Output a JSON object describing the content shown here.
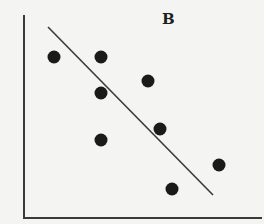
{
  "chart_data": {
    "type": "scatter",
    "title": "B",
    "xlabel": "",
    "ylabel": "",
    "xlim": [
      0,
      10
    ],
    "ylim": [
      0,
      10
    ],
    "grid": false,
    "legend": null,
    "axis_ticks": false,
    "points": [
      {
        "x": 1.26,
        "y": 7.93
      },
      {
        "x": 3.24,
        "y": 7.93
      },
      {
        "x": 3.24,
        "y": 6.16
      },
      {
        "x": 5.21,
        "y": 6.75
      },
      {
        "x": 5.71,
        "y": 4.38
      },
      {
        "x": 3.24,
        "y": 3.84
      },
      {
        "x": 8.19,
        "y": 2.61
      },
      {
        "x": 6.22,
        "y": 1.43
      }
    ],
    "trend_line": {
      "type": "linear",
      "start": {
        "x": 1.01,
        "y": 9.41
      },
      "end": {
        "x": 7.94,
        "y": 1.13
      }
    },
    "point_color": "#1a1a1a",
    "line_color": "#3a3a3a",
    "axis_color": "#3a3a3a"
  },
  "render": {
    "origin_px": {
      "x": 24,
      "y": 218
    },
    "x_axis_end_px": 262,
    "y_axis_top_px": 15,
    "point_radius_px": 6.5,
    "points_px": [
      {
        "x": 54,
        "y": 57
      },
      {
        "x": 101,
        "y": 57
      },
      {
        "x": 101,
        "y": 93
      },
      {
        "x": 148,
        "y": 81
      },
      {
        "x": 160,
        "y": 129
      },
      {
        "x": 101,
        "y": 140
      },
      {
        "x": 219,
        "y": 165
      },
      {
        "x": 172,
        "y": 189
      }
    ],
    "line_px": {
      "x1": 48,
      "y1": 27,
      "x2": 213,
      "y2": 195
    }
  },
  "panel": {
    "label": "B"
  }
}
